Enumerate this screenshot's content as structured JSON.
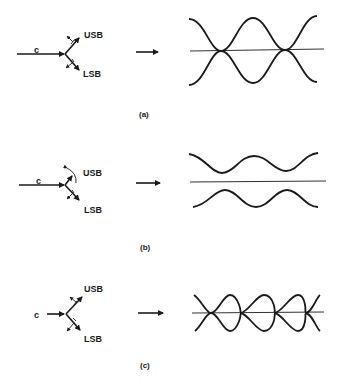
{
  "figure": {
    "panels": [
      {
        "id": "a",
        "caption": "(a)",
        "phasor": {
          "carrier_label": "c",
          "upper_label": "USB",
          "lower_label": "LSB"
        },
        "waveform": "envelopes crossing at centerline (equal amplitudes, 100% modulation)"
      },
      {
        "id": "b",
        "caption": "(b)",
        "phasor": {
          "carrier_label": "c",
          "upper_label": "USB",
          "lower_label": "LSB"
        },
        "waveform": "envelopes separated from centerline (partial modulation)"
      },
      {
        "id": "c",
        "caption": "(c)",
        "phasor": {
          "carrier_label": "c",
          "upper_label": "USB",
          "lower_label": "LSB"
        },
        "waveform": "envelopes crossing (overmodulation, small carrier)"
      }
    ],
    "colors": {
      "ink": "#1a1a1a",
      "background": "#ffffff"
    }
  }
}
